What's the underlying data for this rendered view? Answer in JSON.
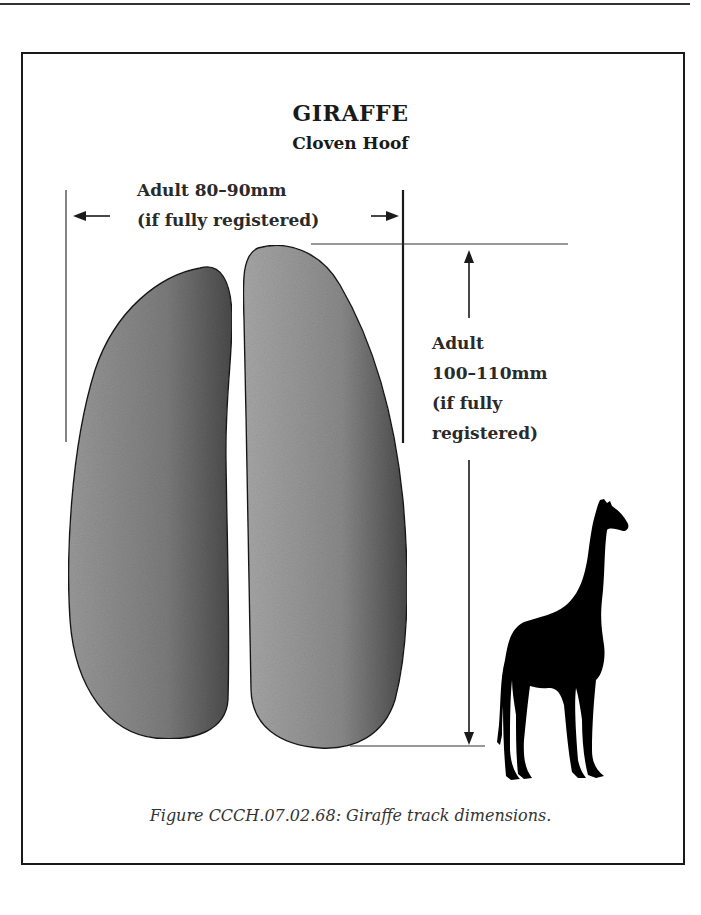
{
  "figure": {
    "title": "GIRAFFE",
    "subtitle": "Cloven Hoof",
    "width_label": {
      "line1": "Adult 80–90mm",
      "line2": "(if fully registered)"
    },
    "length_label": {
      "line1": "Adult",
      "line2": "100–110mm",
      "line3": "(if fully",
      "line4": "registered)"
    },
    "caption": "Figure CCCH.07.02.68:  Giraffe track dimensions.",
    "icons": {
      "left_arrow": "arrow-left-icon",
      "right_arrow": "arrow-right-icon",
      "up_arrow": "arrow-up-icon",
      "down_arrow": "arrow-down-icon",
      "silhouette": "giraffe-silhouette-icon"
    },
    "colors": {
      "frame": "#1a1a1a",
      "hoof_light": "#a8a8a8",
      "hoof_dark": "#4a4a4a",
      "silhouette": "#000000"
    }
  }
}
